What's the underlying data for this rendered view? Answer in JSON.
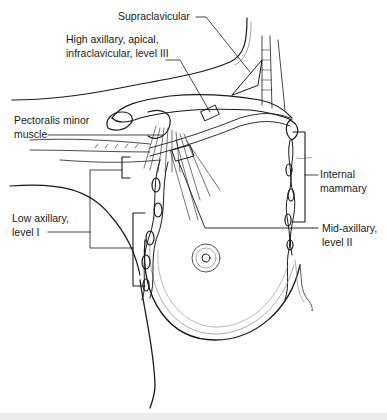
{
  "figure": {
    "labels": {
      "supraclavicular": "Supraclavicular",
      "high_axillary_line1": "High axillary, apical,",
      "high_axillary_line2": "infraclavicular, level III",
      "pectoralis_line1": "Pectoralis minor",
      "pectoralis_line2": "muscle",
      "internal_mammary_line1": "Internal",
      "internal_mammary_line2": "mammary",
      "low_axillary_line1": "Low axillary,",
      "low_axillary_line2": "level I",
      "mid_axillary_line1": "Mid-axillary,",
      "mid_axillary_line2": "level II"
    },
    "colors": {
      "line": "#1a1a1a",
      "light_line": "#8a8a8a",
      "background": "#ffffff",
      "band": "#ececec"
    }
  }
}
